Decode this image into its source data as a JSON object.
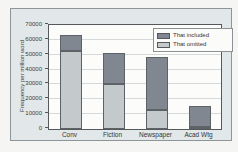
{
  "figure": {
    "page_background": "#f5f5f3",
    "figure_background": "#e2e7e9",
    "frame_border_color": "#8e9599",
    "plot_background": "#fcfcfb",
    "axis_color": "#55595c",
    "gridline_color": "#d6d9d9"
  },
  "chart_data": {
    "type": "bar",
    "stacked": true,
    "title": "",
    "xlabel": "",
    "ylabel": "Frequency per million word",
    "categories": [
      "Conv",
      "Fiction",
      "Newspaper",
      "Acad Wtg"
    ],
    "series": [
      {
        "name": "That included",
        "color": "#808790",
        "values": [
          10500,
          21000,
          35500,
          14000
        ]
      },
      {
        "name": "That omitted",
        "color": "#c4c9cc",
        "values": [
          52500,
          30500,
          13000,
          1000
        ]
      }
    ],
    "totals": [
      63000,
      51500,
      48500,
      15000
    ],
    "ylim": [
      0,
      70000
    ],
    "yticks": [
      0,
      10000,
      20000,
      30000,
      40000,
      50000,
      60000,
      70000
    ],
    "grid": true,
    "legend_position": "top-right"
  }
}
